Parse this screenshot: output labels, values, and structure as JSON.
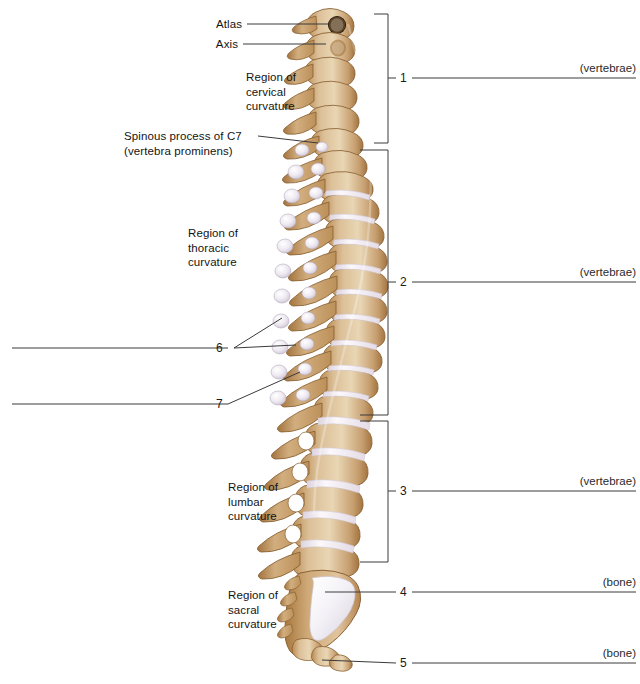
{
  "figure": {
    "bone_color": "#c9a172",
    "bone_light": "#e8d2ae",
    "bone_shadow": "#a8784b",
    "disc_color": "#f2eef4",
    "line_color": "#3a3a3a",
    "text_color": "#141414"
  },
  "region_labels": [
    {
      "id": "atlas",
      "text": "Atlas",
      "lines": [
        "Atlas"
      ]
    },
    {
      "id": "axis",
      "text": "Axis",
      "lines": [
        "Axis"
      ]
    },
    {
      "id": "cervical-curvature",
      "text": "Region of cervical curvature",
      "lines": [
        "Region of",
        "cervical",
        "curvature"
      ]
    },
    {
      "id": "spinous-process-c7",
      "text": "Spinous process of C7 (vertebra prominens)",
      "lines": [
        "Spinous process of C7",
        "(vertebra prominens)"
      ]
    },
    {
      "id": "thoracic-curvature",
      "text": "Region of thoracic curvature",
      "lines": [
        "Region of",
        "thoracic",
        "curvature"
      ]
    },
    {
      "id": "lumbar-curvature",
      "text": "Region of lumbar curvature",
      "lines": [
        "Region of",
        "lumbar",
        "curvature"
      ]
    },
    {
      "id": "sacral-curvature",
      "text": "Region of sacral curvature",
      "lines": [
        "Region of",
        "sacral",
        "curvature"
      ]
    }
  ],
  "numbered_callouts": [
    {
      "number": "1",
      "side": "right",
      "style": "bracket",
      "suffix": "(vertebrae)",
      "answer_blank": true
    },
    {
      "number": "2",
      "side": "right",
      "style": "bracket",
      "suffix": "(vertebrae)",
      "answer_blank": true
    },
    {
      "number": "3",
      "side": "right",
      "style": "bracket",
      "suffix": "(vertebrae)",
      "answer_blank": true
    },
    {
      "number": "4",
      "side": "right",
      "style": "leader",
      "suffix": "(bone)",
      "answer_blank": true
    },
    {
      "number": "5",
      "side": "right",
      "style": "leader",
      "suffix": "(bone)",
      "answer_blank": true
    },
    {
      "number": "6",
      "side": "left",
      "style": "leader",
      "suffix": "",
      "answer_blank": true
    },
    {
      "number": "7",
      "side": "left",
      "style": "leader",
      "suffix": "",
      "answer_blank": true
    }
  ],
  "numbers": {
    "n1": "1",
    "n2": "2",
    "n3": "3",
    "n4": "4",
    "n5": "5",
    "n6": "6",
    "n7": "7"
  },
  "suffixes": {
    "s1": "(vertebrae)",
    "s2": "(vertebrae)",
    "s3": "(vertebrae)",
    "s4": "(bone)",
    "s5": "(bone)"
  },
  "text": {
    "atlas": "Atlas",
    "axis": "Axis",
    "cervical_1": "Region of",
    "cervical_2": "cervical",
    "cervical_3": "curvature",
    "c7_1": "Spinous process of C7",
    "c7_2": "(vertebra prominens)",
    "thoracic_1": "Region of",
    "thoracic_2": "thoracic",
    "thoracic_3": "curvature",
    "lumbar_1": "Region of",
    "lumbar_2": "lumbar",
    "lumbar_3": "curvature",
    "sacral_1": "Region of",
    "sacral_2": "sacral",
    "sacral_3": "curvature"
  }
}
